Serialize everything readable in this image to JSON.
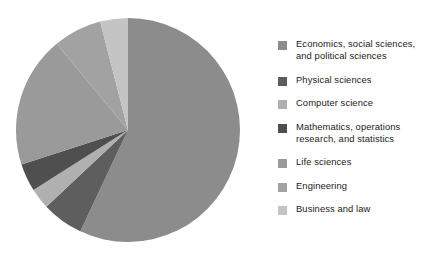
{
  "chart_data": {
    "type": "pie",
    "title": "",
    "legend_position": "right",
    "categories": [
      "Economics, social sciences,\nand political sciences",
      "Physical sciences",
      "Computer science",
      "Mathematics, operations\nresearch, and statistics",
      "Life sciences",
      "Engineering",
      "Business and law"
    ],
    "values": [
      57,
      6,
      3,
      4,
      19,
      7,
      4
    ],
    "colors": [
      "#8c8c8c",
      "#5e5e5e",
      "#b0b0b0",
      "#4f4f4f",
      "#9a9a9a",
      "#a2a2a2",
      "#c4c4c4"
    ],
    "start_angle_deg": 0,
    "direction": "clockwise",
    "center": {
      "x": 112,
      "y": 112
    },
    "radius": 112
  },
  "legend": {
    "items": [
      {
        "label": "Economics, social sciences,\nand political sciences",
        "color": "#8c8c8c"
      },
      {
        "label": "Physical sciences",
        "color": "#5e5e5e"
      },
      {
        "label": "Computer science",
        "color": "#b0b0b0"
      },
      {
        "label": "Mathematics, operations\nresearch, and statistics",
        "color": "#4f4f4f"
      },
      {
        "label": "Life sciences",
        "color": "#9a9a9a"
      },
      {
        "label": "Engineering",
        "color": "#a2a2a2"
      },
      {
        "label": "Business and law",
        "color": "#c4c4c4"
      }
    ]
  }
}
